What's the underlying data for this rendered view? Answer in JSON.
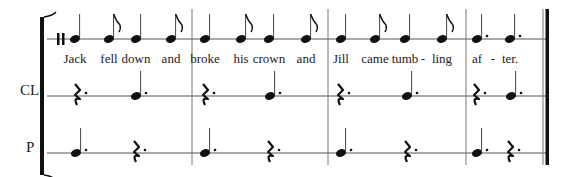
{
  "score": {
    "staves": [
      {
        "id": "voice",
        "label": "",
        "y": 39
      },
      {
        "id": "cl",
        "label": "CL",
        "y": 96
      },
      {
        "id": "p",
        "label": "P",
        "y": 153
      }
    ],
    "barlines_x": [
      192,
      328,
      466
    ],
    "final_barline": {
      "thin_x": 543,
      "thick_x": 547
    },
    "start_x": 47,
    "end_x": 548,
    "voice": {
      "events": [
        {
          "x": 75,
          "type": "quarter",
          "lyric": "Jack"
        },
        {
          "x": 109,
          "type": "eighth",
          "lyric": "fell"
        },
        {
          "x": 136,
          "type": "quarter",
          "lyric": "down"
        },
        {
          "x": 171,
          "type": "eighth",
          "lyric": "and"
        },
        {
          "x": 205,
          "type": "quarter",
          "lyric": "broke"
        },
        {
          "x": 241,
          "type": "eighth",
          "lyric": "his"
        },
        {
          "x": 269,
          "type": "quarter",
          "lyric": "crown"
        },
        {
          "x": 306,
          "type": "eighth",
          "lyric": "and"
        },
        {
          "x": 341,
          "type": "quarter",
          "lyric": "Jill"
        },
        {
          "x": 375,
          "type": "eighth",
          "lyric": "came"
        },
        {
          "x": 405,
          "type": "quarter",
          "lyric": "tumb"
        },
        {
          "x": 442,
          "type": "eighth",
          "lyric": "ling"
        },
        {
          "x": 477,
          "type": "dotted-quarter",
          "lyric": "af"
        },
        {
          "x": 510,
          "type": "dotted-quarter",
          "lyric": "ter."
        }
      ],
      "hyphens": [
        {
          "x": 423,
          "text": "-"
        },
        {
          "x": 493,
          "text": "-"
        }
      ]
    },
    "cl": {
      "events": [
        {
          "x": 77,
          "type": "dotted-rest"
        },
        {
          "x": 136,
          "type": "dotted-quarter"
        },
        {
          "x": 205,
          "type": "dotted-rest"
        },
        {
          "x": 270,
          "type": "dotted-quarter"
        },
        {
          "x": 340,
          "type": "dotted-rest"
        },
        {
          "x": 407,
          "type": "dotted-quarter"
        },
        {
          "x": 476,
          "type": "dotted-rest"
        },
        {
          "x": 511,
          "type": "dotted-quarter"
        }
      ]
    },
    "p": {
      "events": [
        {
          "x": 76,
          "type": "dotted-quarter"
        },
        {
          "x": 136,
          "type": "dotted-rest"
        },
        {
          "x": 205,
          "type": "dotted-quarter"
        },
        {
          "x": 270,
          "type": "dotted-rest"
        },
        {
          "x": 341,
          "type": "dotted-quarter"
        },
        {
          "x": 407,
          "type": "dotted-rest"
        },
        {
          "x": 477,
          "type": "dotted-quarter"
        },
        {
          "x": 510,
          "type": "dotted-rest"
        }
      ]
    },
    "colors": {
      "ink": "#111111",
      "line": "#555555"
    }
  }
}
